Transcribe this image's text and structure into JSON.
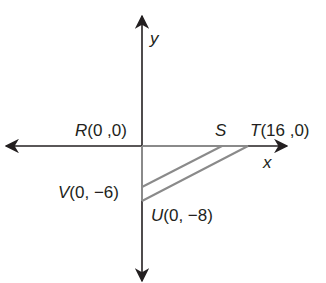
{
  "diagram": {
    "axes": {
      "x_label": "x",
      "y_label": "y",
      "axis_color": "#231f20"
    },
    "figure_color": "#8a8a8a",
    "points": {
      "R": {
        "name": "R",
        "coords": "(0 ,0)"
      },
      "S": {
        "name": "S",
        "coords": ""
      },
      "T": {
        "name": "T",
        "coords": "(16 ,0)"
      },
      "V": {
        "name": "V",
        "coords": "(0, −6)"
      },
      "U": {
        "name": "U",
        "coords": "(0, −8)"
      }
    }
  }
}
